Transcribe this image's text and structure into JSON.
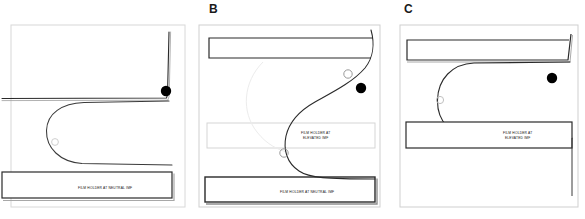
{
  "figure": {
    "background_color": "#ffffff",
    "ink_color": "#111111",
    "marker_color": "#000000",
    "panel_count": 3
  },
  "panels": [
    {
      "id": "panel-a",
      "letter": "",
      "letter_visible": false,
      "labels": [
        {
          "name": "film-holder-neutral-label",
          "text": "FILM HOLDER AT NEUTRAL IMF",
          "position": "bottom-bar-right"
        }
      ],
      "markers": [
        {
          "name": "reference-dot",
          "shape": "filled-circle",
          "color": "#000000",
          "x": 166,
          "y": 91,
          "r": 5.2
        },
        {
          "name": "open-circle-landmark",
          "shape": "open-circle",
          "color": "#cfcfcf",
          "x": 55,
          "y": 142,
          "r": 3.4
        }
      ],
      "shapes": [
        {
          "name": "film-holder-bar-bottom",
          "type": "rectangle-outline"
        },
        {
          "name": "anatomy-curve",
          "type": "u-shaped-path"
        },
        {
          "name": "upper-boundary-line",
          "type": "polyline"
        },
        {
          "name": "panel-frame",
          "type": "rectangle-outline"
        }
      ]
    },
    {
      "id": "panel-b",
      "letter": "B",
      "letter_visible": true,
      "labels": [
        {
          "name": "film-holder-elevated-label",
          "text": "FILM HOLDER AT\nELEVATED IMF",
          "position": "middle-bar-right"
        },
        {
          "name": "film-holder-neutral-label",
          "text": "FILM HOLDER AT NEUTRAL IMF",
          "position": "bottom-bar-right"
        }
      ],
      "markers": [
        {
          "name": "reference-dot",
          "shape": "filled-circle",
          "color": "#000000",
          "x": 166,
          "y": 88,
          "r": 5.2
        },
        {
          "name": "open-circle-landmark-upper",
          "shape": "open-circle",
          "color": "#9a9a9a",
          "x": 153,
          "y": 74,
          "r": 4.2
        },
        {
          "name": "open-circle-landmark-lower",
          "shape": "open-circle",
          "color": "#9a9a9a",
          "x": 89,
          "y": 153,
          "r": 4.2
        }
      ],
      "shapes": [
        {
          "name": "film-holder-bar-top",
          "type": "rectangle-outline"
        },
        {
          "name": "film-holder-bar-middle",
          "type": "rectangle-outline-light"
        },
        {
          "name": "film-holder-bar-bottom",
          "type": "rectangle-outline-heavy"
        },
        {
          "name": "anatomy-curve",
          "type": "s-shaped-path"
        },
        {
          "name": "panel-frame",
          "type": "rectangle-outline"
        }
      ]
    },
    {
      "id": "panel-c",
      "letter": "C",
      "letter_visible": true,
      "labels": [
        {
          "name": "film-holder-elevated-label",
          "text": "FILM HOLDER AT\nELEVATED IMF",
          "position": "middle-bar-right"
        }
      ],
      "markers": [
        {
          "name": "reference-dot",
          "shape": "filled-circle",
          "color": "#000000",
          "x": 162,
          "y": 78,
          "r": 5.2
        },
        {
          "name": "open-circle-landmark",
          "shape": "open-circle",
          "color": "#c0c0c0",
          "x": 50,
          "y": 100,
          "r": 3.6
        }
      ],
      "shapes": [
        {
          "name": "film-holder-bar-top",
          "type": "rectangle-outline"
        },
        {
          "name": "film-holder-bar-middle",
          "type": "rectangle-outline"
        },
        {
          "name": "anatomy-curve",
          "type": "u-shaped-path"
        },
        {
          "name": "panel-frame",
          "type": "rectangle-outline"
        }
      ]
    }
  ]
}
